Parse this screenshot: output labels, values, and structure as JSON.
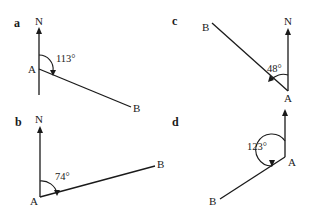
{
  "diagrams": [
    {
      "panel": "a",
      "north_label": "N",
      "point_a_label": "A",
      "point_b_label": "B",
      "bearing": "113°"
    },
    {
      "panel": "b",
      "north_label": "N",
      "point_a_label": "A",
      "point_b_label": "B",
      "bearing": "74°"
    },
    {
      "panel": "c",
      "north_label": "N",
      "point_a_label": "A",
      "point_b_label": "B",
      "bearing": "48°"
    },
    {
      "panel": "d",
      "north_label": "",
      "point_a_label": "A",
      "point_b_label": "B",
      "bearing": "123°"
    }
  ],
  "colors": {
    "ink": "#1a1a1a",
    "background": "#ffffff"
  }
}
